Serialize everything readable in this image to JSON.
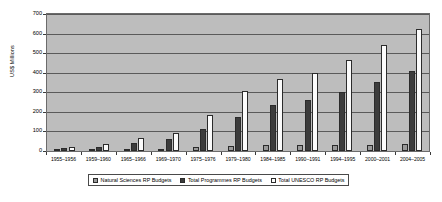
{
  "chart_data": {
    "type": "bar",
    "title": "",
    "xlabel": "",
    "ylabel": "US$ Millions",
    "ylim": [
      0,
      700
    ],
    "yticks": [
      0,
      100,
      200,
      300,
      400,
      500,
      600,
      700
    ],
    "grid": true,
    "legend_position": "bottom",
    "categories": [
      "1955–1956",
      "1959–1960",
      "1965–1966",
      "1969–1970",
      "1975–1976",
      "1979–1980",
      "1984–1985",
      "1990–1991",
      "1994–1995",
      "2000–2001",
      "2004–2005"
    ],
    "series": [
      {
        "name": "Natural Sciences RP Budgets",
        "color": "#9a9a9a",
        "values": [
          3,
          5,
          8,
          12,
          20,
          27,
          30,
          33,
          29,
          32,
          34
        ]
      },
      {
        "name": "Total Programmes RP Budgets",
        "color": "#3c3c3c",
        "values": [
          14,
          23,
          42,
          60,
          110,
          175,
          235,
          260,
          300,
          355,
          411
        ]
      },
      {
        "name": "Total UNESCO RP Budgets",
        "color": "#fbfbfb",
        "values": [
          23,
          36,
          68,
          92,
          185,
          305,
          370,
          400,
          467,
          544,
          624
        ]
      }
    ]
  },
  "legend": {
    "items": [
      "Natural Sciences RP Budgets",
      "Total Programmes RP Budgets",
      "Total UNESCO RP Budgets"
    ]
  },
  "axes": {
    "y_title": "US$ Millions"
  }
}
